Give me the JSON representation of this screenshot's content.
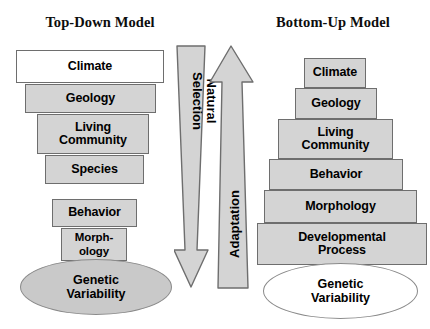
{
  "figure": {
    "background_color": "#ffffff",
    "box_fill_color": "#d4d4d4",
    "box_border_color": "#6e6e6e",
    "arrow_fill_color": "#d4d4d4",
    "arrow_border_color": "#6e6e6e",
    "text_color": "#000000"
  },
  "left_model": {
    "title": "Top-Down Model",
    "tiers": [
      {
        "label": "Climate",
        "fill": "white"
      },
      {
        "label": "Geology",
        "fill": "gray"
      },
      {
        "label": "Living\nCommunity",
        "fill": "gray"
      },
      {
        "label": "Species",
        "fill": "gray"
      },
      {
        "label": "Behavior",
        "fill": "gray"
      },
      {
        "label": "Morph-\nology",
        "fill": "gray"
      }
    ],
    "base": {
      "label": "Genetic\nVariability",
      "shape": "ellipse",
      "fill": "gray"
    }
  },
  "right_model": {
    "title": "Bottom-Up Model",
    "tiers": [
      {
        "label": "Climate",
        "fill": "gray"
      },
      {
        "label": "Geology",
        "fill": "gray"
      },
      {
        "label": "Living\nCommunity",
        "fill": "gray"
      },
      {
        "label": "Behavior",
        "fill": "gray"
      },
      {
        "label": "Morphology",
        "fill": "gray"
      },
      {
        "label": "Developmental\nProcess",
        "fill": "gray"
      }
    ],
    "base": {
      "label": "Genetic\nVariability",
      "shape": "ellipse",
      "fill": "white"
    }
  },
  "arrows": [
    {
      "name": "natural-selection-arrow",
      "label": "Natural\nSelection",
      "direction": "down"
    },
    {
      "name": "adaptation-arrow",
      "label": "Adaptation",
      "direction": "up"
    }
  ]
}
